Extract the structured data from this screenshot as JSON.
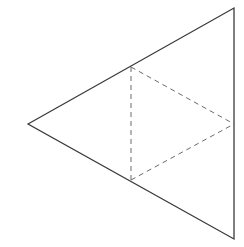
{
  "diagram": {
    "type": "tetrahedron-net",
    "colors": {
      "background": "#ffffff",
      "outline": "#3a3a3a",
      "fold_line": "#6a6a6a"
    },
    "outer_triangle": {
      "vertices": [
        [
          28,
          124
        ],
        [
          234,
          8
        ],
        [
          234,
          239
        ]
      ],
      "stroke_width": 1.3
    },
    "fold_lines": {
      "dash_pattern": "5 4",
      "stroke_width": 1,
      "segments": [
        {
          "name": "top-to-bottom-midpoint",
          "x1": 131,
          "y1": 67,
          "x2": 131,
          "y2": 180
        },
        {
          "name": "top-to-right-midpoint",
          "x1": 131,
          "y1": 67,
          "x2": 234,
          "y2": 124
        },
        {
          "name": "bottom-to-right-midpoint",
          "x1": 131,
          "y1": 180,
          "x2": 234,
          "y2": 124
        }
      ]
    }
  }
}
